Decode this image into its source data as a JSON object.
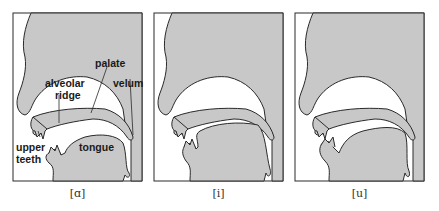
{
  "colors": {
    "tissue": "#c8c8c8",
    "outline": "#2a2a2a",
    "air": "#ffffff"
  },
  "panels": [
    {
      "caption": "[ɑ]",
      "labels": {
        "palate": "palate",
        "alveolar_1": "alveolar",
        "alveolar_2": "ridge",
        "velum": "velum",
        "upper_teeth_1": "upper",
        "upper_teeth_2": "teeth",
        "tongue": "tongue"
      }
    },
    {
      "caption": "[i]"
    },
    {
      "caption": "[u]"
    }
  ]
}
